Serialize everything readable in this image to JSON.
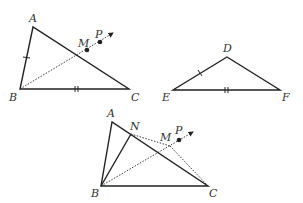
{
  "figures": [
    {
      "id": "figure-top-left",
      "description": "Triangle ABC with ray from B through M and P",
      "labels": {
        "A": "A",
        "B": "B",
        "C": "C",
        "M": "M",
        "P": "P"
      }
    },
    {
      "id": "figure-right",
      "description": "Triangle DEF",
      "labels": {
        "D": "D",
        "E": "E",
        "F": "F"
      }
    },
    {
      "id": "figure-bottom",
      "description": "Triangle ABC with point N on AC, segment BN, dotted NC, ray from B through M and P",
      "labels": {
        "A": "A",
        "B": "B",
        "C": "C",
        "N": "N",
        "M": "M",
        "P": "P"
      }
    }
  ],
  "colors": {
    "stroke": "#222222",
    "label": "#333333",
    "background": "#ffffff"
  }
}
